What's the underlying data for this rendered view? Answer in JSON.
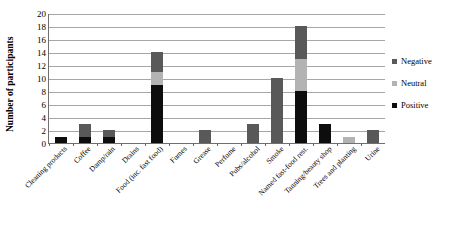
{
  "chart_data": {
    "type": "bar",
    "title": "",
    "subtitle": "",
    "xlabel": "",
    "ylabel": "Number of participants",
    "ylim": [
      0,
      20
    ],
    "ytick_step": 2,
    "yticks": [
      0,
      2,
      4,
      6,
      8,
      10,
      12,
      14,
      16,
      18,
      20
    ],
    "grid": true,
    "stacked": true,
    "legend_position": "right",
    "orientation": "vertical",
    "categories": [
      "Cleaning products",
      "Coffee",
      "Damp/rain",
      "Drains",
      "Food (inc. fast food)",
      "Fumes",
      "Grease",
      "Perfume",
      "Pubs/alcohol",
      "Smoke",
      "Named fast-food rest.",
      "Tanning/beauty shop",
      "Trees and planting",
      "Urine"
    ],
    "series": [
      {
        "name": "Positive",
        "color": "#0d0d0d",
        "values": [
          1,
          1,
          1,
          0,
          9,
          0,
          0,
          0,
          0,
          0,
          8,
          3,
          0,
          0
        ]
      },
      {
        "name": "Neutral",
        "color": "#b3b3b3",
        "values": [
          0,
          0,
          0,
          0,
          2,
          0,
          0,
          0,
          0,
          0,
          5,
          0,
          1,
          0
        ]
      },
      {
        "name": "Negative",
        "color": "#595959",
        "values": [
          0,
          2,
          1,
          0,
          3,
          0,
          2,
          0,
          3,
          10,
          5,
          0,
          0,
          2
        ]
      }
    ],
    "totals": [
      1,
      3,
      2,
      0,
      14,
      0,
      2,
      0,
      3,
      10,
      18,
      3,
      1,
      2
    ],
    "stack_order_bottom_to_top": [
      "Positive",
      "Neutral",
      "Negative"
    ],
    "legend_entries": [
      {
        "label": "Negative",
        "color": "#595959"
      },
      {
        "label": "Neutral",
        "color": "#b3b3b3"
      },
      {
        "label": "Positive",
        "color": "#0d0d0d"
      }
    ]
  }
}
